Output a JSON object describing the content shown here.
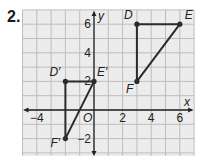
{
  "problem_number": "2.",
  "grid": {
    "x_min": -5,
    "x_max": 7,
    "y_min": -3,
    "y_max": 7,
    "origin_px": [
      94,
      110
    ],
    "unit_px": 14.3,
    "grid_color": "#bdbdbd",
    "background": "#ececec"
  },
  "axes": {
    "x_label": "x",
    "y_label": "y",
    "origin_label": "O",
    "x_ticks": [
      {
        "value": -4,
        "label": "−4"
      },
      {
        "value": 2,
        "label": "2"
      },
      {
        "value": 4,
        "label": "4"
      },
      {
        "value": 6,
        "label": "6"
      }
    ],
    "y_ticks": [
      {
        "value": 6,
        "label": "6"
      },
      {
        "value": 4,
        "label": "4"
      },
      {
        "value": 2,
        "label": "2"
      },
      {
        "value": -2,
        "label": "−2"
      }
    ]
  },
  "figures": [
    {
      "name": "DEF",
      "points": [
        {
          "label": "D",
          "x": 3,
          "y": 6
        },
        {
          "label": "E",
          "x": 6,
          "y": 6
        },
        {
          "label": "F",
          "x": 3,
          "y": 2
        }
      ]
    },
    {
      "name": "D'E'F'",
      "points": [
        {
          "label": "D′",
          "x": -2,
          "y": 2
        },
        {
          "label": "E′",
          "x": 0,
          "y": 2
        },
        {
          "label": "F′",
          "x": -2,
          "y": -2
        }
      ]
    }
  ],
  "line_color": "#2b2b2b"
}
